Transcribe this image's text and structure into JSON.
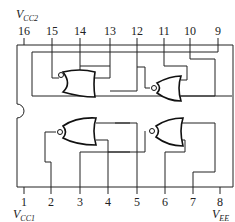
{
  "labels": {
    "vcc2": "V",
    "vcc2_sub": "CC2",
    "vcc1": "V",
    "vcc1_sub": "CC1",
    "vee": "V",
    "vee_sub": "EE"
  },
  "top_pins": [
    "16",
    "15",
    "14",
    "13",
    "12",
    "11",
    "10",
    "9"
  ],
  "bottom_pins": [
    "1",
    "2",
    "3",
    "4",
    "5",
    "6",
    "7",
    "8"
  ],
  "gates": [
    {
      "name": "top-left-nor",
      "type": "NOR",
      "inputs": [
        "14",
        "13"
      ],
      "output": "15"
    },
    {
      "name": "top-right-nor",
      "type": "NOR",
      "inputs": [
        "11",
        "10"
      ],
      "output": "12"
    },
    {
      "name": "bottom-left-nor",
      "type": "NOR",
      "inputs": [
        "3",
        "4"
      ],
      "output": "2"
    },
    {
      "name": "bottom-right-nor",
      "type": "NOR",
      "inputs": [
        "6",
        "7"
      ],
      "output": "5"
    }
  ],
  "colors": {
    "line": "#222222",
    "background": "#ffffff"
  }
}
